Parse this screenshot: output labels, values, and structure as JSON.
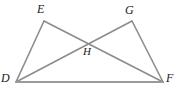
{
  "figure": {
    "stroke_color": "#8c8c8c",
    "label_color": "#1a1a1a",
    "background_color": "#ffffff",
    "stroke_width": 1.6
  },
  "points": {
    "E": {
      "label": "E",
      "x": 44,
      "y": 21
    },
    "G": {
      "label": "G",
      "x": 132,
      "y": 21
    },
    "D": {
      "label": "D",
      "x": 16,
      "y": 82
    },
    "F": {
      "label": "F",
      "x": 163,
      "y": 82
    },
    "H": {
      "label": "H",
      "x": 87,
      "y": 41
    }
  },
  "segments": [
    {
      "name": "segment-DE",
      "from": "D",
      "to": "E"
    },
    {
      "name": "segment-EF",
      "from": "E",
      "to": "F"
    },
    {
      "name": "segment-DG",
      "from": "D",
      "to": "G"
    },
    {
      "name": "segment-GF",
      "from": "G",
      "to": "F"
    },
    {
      "name": "segment-DF",
      "from": "D",
      "to": "F"
    }
  ]
}
